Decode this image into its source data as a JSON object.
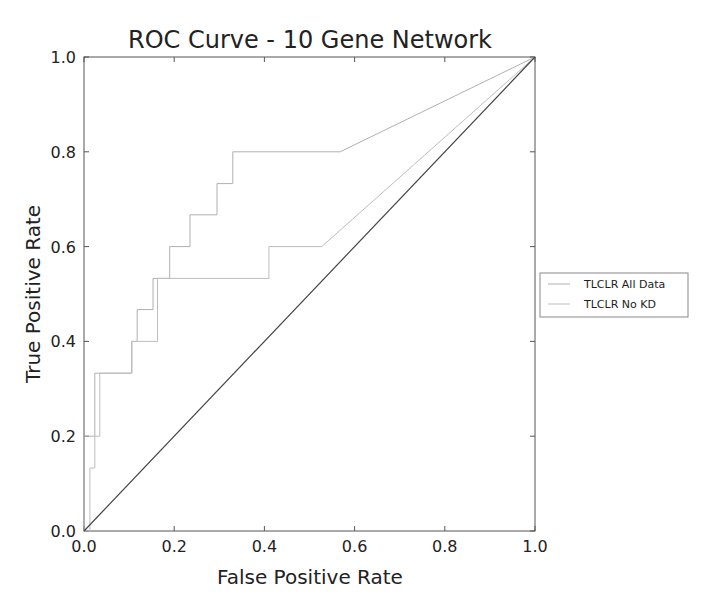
{
  "chart_data": {
    "type": "line",
    "title": "ROC Curve - 10 Gene Network",
    "xlabel": "False Positive Rate",
    "ylabel": "True Positive Rate",
    "xlim": [
      0.0,
      1.0
    ],
    "ylim": [
      0.0,
      1.0
    ],
    "xticks": [
      "0.0",
      "0.2",
      "0.4",
      "0.6",
      "0.8",
      "1.0"
    ],
    "yticks": [
      "0.0",
      "0.2",
      "0.4",
      "0.6",
      "0.8",
      "1.0"
    ],
    "grid": false,
    "legend_position": "right, outside plot",
    "series": [
      {
        "name": "TLCLR All Data",
        "color": "#b0b0b0",
        "x": [
          0.0,
          0.0,
          0.024,
          0.024,
          0.106,
          0.106,
          0.118,
          0.118,
          0.153,
          0.153,
          0.19,
          0.19,
          0.235,
          0.235,
          0.295,
          0.295,
          0.33,
          0.33,
          0.568,
          1.0
        ],
        "y": [
          0.0,
          0.2,
          0.2,
          0.333,
          0.333,
          0.4,
          0.4,
          0.467,
          0.467,
          0.533,
          0.533,
          0.6,
          0.6,
          0.667,
          0.667,
          0.733,
          0.733,
          0.8,
          0.8,
          1.0
        ]
      },
      {
        "name": "TLCLR No KD",
        "color": "#bdbdbd",
        "x": [
          0.0,
          0.013,
          0.013,
          0.024,
          0.024,
          0.035,
          0.035,
          0.106,
          0.106,
          0.163,
          0.163,
          0.41,
          0.41,
          0.527,
          1.0
        ],
        "y": [
          0.0,
          0.0,
          0.133,
          0.133,
          0.2,
          0.2,
          0.333,
          0.333,
          0.4,
          0.4,
          0.533,
          0.533,
          0.6,
          0.6,
          1.0
        ]
      },
      {
        "name": "Random (diagonal)",
        "color": "#444444",
        "x": [
          0.0,
          1.0
        ],
        "y": [
          0.0,
          1.0
        ],
        "in_legend": false
      }
    ]
  },
  "legend": {
    "items": [
      {
        "label": "TLCLR All Data"
      },
      {
        "label": "TLCLR No KD"
      }
    ]
  }
}
